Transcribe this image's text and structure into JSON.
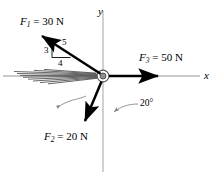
{
  "figure": {
    "background_color": "#ffffff"
  },
  "axes": {
    "x_label": "x",
    "y_label": "y",
    "color": "#b3b3b3",
    "origin": {
      "x": 103,
      "y": 76
    }
  },
  "forces": [
    {
      "name": "F1",
      "label_prefix": "F",
      "subscript": "1",
      "equals": " = ",
      "magnitude": "30",
      "unit": "N",
      "full_label": "F1 = 30 N",
      "color": "#000000",
      "direction": "up-left along 3-4-5 slope"
    },
    {
      "name": "F2",
      "label_prefix": "F",
      "subscript": "2",
      "equals": " = ",
      "magnitude": "20",
      "unit": "N",
      "full_label": "F2 = 20 N",
      "color": "#000000",
      "direction": "down-left, 20 degrees from negative y-axis"
    },
    {
      "name": "F3",
      "label_prefix": "F",
      "subscript": "3",
      "equals": " = ",
      "magnitude": "50",
      "unit": "N",
      "full_label": "F3 = 50 N",
      "color": "#000000",
      "direction": "along positive x-axis"
    }
  ],
  "slope_triangle": {
    "hypotenuse": "5",
    "vertical": "3",
    "horizontal": "4"
  },
  "angle_annotation": {
    "value": "20",
    "degree_symbol": "°",
    "text": "20°"
  }
}
